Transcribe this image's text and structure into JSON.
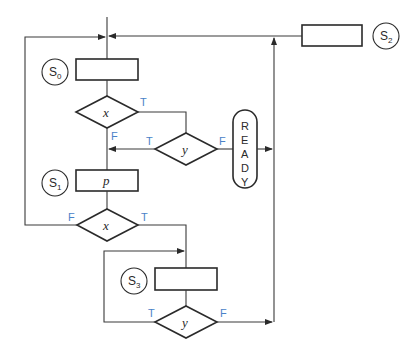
{
  "diagram": {
    "type": "ASM flowchart",
    "states": [
      {
        "id": "S0",
        "name": "S",
        "sub": "0",
        "output": ""
      },
      {
        "id": "S1",
        "name": "S",
        "sub": "1",
        "output": "p"
      },
      {
        "id": "S2",
        "name": "S",
        "sub": "2",
        "output": ""
      },
      {
        "id": "S3",
        "name": "S",
        "sub": "3",
        "output": ""
      }
    ],
    "decisions": [
      {
        "id": "x1",
        "var": "x",
        "true_label": "T",
        "false_label": "F"
      },
      {
        "id": "y1",
        "var": "y",
        "true_label": "T",
        "false_label": "F"
      },
      {
        "id": "x2",
        "var": "x",
        "true_label": "T",
        "false_label": "F"
      },
      {
        "id": "y2",
        "var": "y",
        "true_label": "T",
        "false_label": "F"
      }
    ],
    "conditional_output": {
      "text": "READY",
      "letters": [
        "R",
        "E",
        "A",
        "D",
        "Y"
      ]
    },
    "colors": {
      "line": "#3a3a3a",
      "branch_label": "#4a82c8"
    }
  }
}
